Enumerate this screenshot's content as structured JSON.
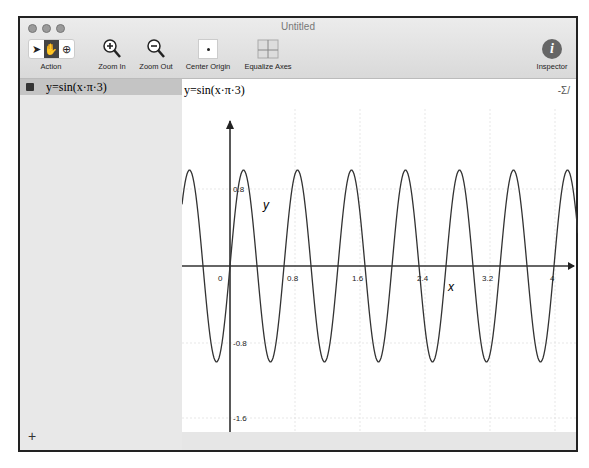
{
  "window": {
    "title": "Untitled"
  },
  "toolbar": {
    "action_label": "Action",
    "zoom_in_label": "Zoom In",
    "zoom_out_label": "Zoom Out",
    "center_origin_label": "Center Origin",
    "equalize_axes_label": "Equalize Axes",
    "inspector_label": "Inspector"
  },
  "sidebar": {
    "equations": [
      {
        "text": "y=sin(x·π·3)",
        "checked": true
      }
    ],
    "add_label": "+"
  },
  "graph": {
    "header": "y=sin(x·π·3)",
    "sigma_label": "-Σ/",
    "x_label": "x",
    "y_label": "y"
  },
  "chart_data": {
    "type": "line",
    "title": "y=sin(x·π·3)",
    "xlabel": "x",
    "ylabel": "y",
    "function": "sin(3*pi*x)",
    "x_ticks": [
      "0",
      "0.8",
      "1.6",
      "2.4",
      "3.2",
      "4"
    ],
    "y_ticks": [
      "0.8",
      "-0.8",
      "-1.6"
    ],
    "xlim": [
      -0.6,
      4.3
    ],
    "ylim": [
      -1.75,
      1.5
    ],
    "grid": true
  }
}
